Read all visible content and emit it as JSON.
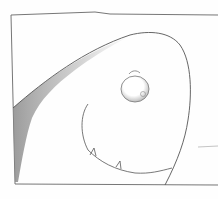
{
  "image": {
    "description": "Pencil sketch comic panel of a rounded creature head with a single eye and a mouth with small teeth",
    "colors": {
      "paper": "#fefefe",
      "line": "#555555",
      "shading": "#9a9a9a"
    }
  }
}
